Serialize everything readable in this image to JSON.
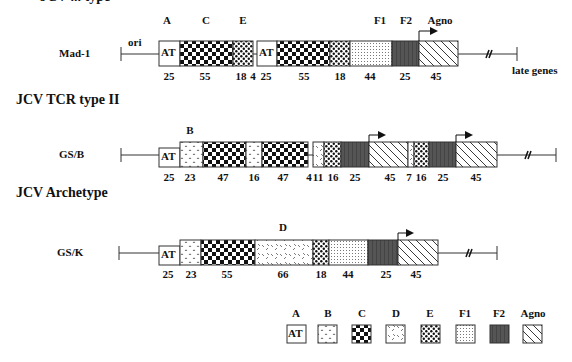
{
  "clipped_title": "JCV ... type",
  "sections": [
    {
      "title": "",
      "row_label": "Mad-1",
      "ori_label": "ori",
      "late_label": "late genes",
      "top_labels": [
        {
          "text": "A",
          "x": 167
        },
        {
          "text": "C",
          "x": 206
        },
        {
          "text": "E",
          "x": 243
        },
        {
          "text": "F1",
          "x": 380
        },
        {
          "text": "F2",
          "x": 406
        },
        {
          "text": "Agno",
          "x": 440
        }
      ],
      "segments": [
        {
          "type": "A",
          "length": 25
        },
        {
          "type": "C",
          "length": 55
        },
        {
          "type": "E",
          "length": 18
        },
        {
          "type": "gap",
          "length": 4
        },
        {
          "type": "A",
          "length": 25
        },
        {
          "type": "C",
          "length": 55
        },
        {
          "type": "E",
          "length": 18
        },
        {
          "type": "F1",
          "length": 44
        },
        {
          "type": "F2",
          "length": 25
        },
        {
          "type": "Agno",
          "length": 45
        }
      ],
      "numbers": [
        {
          "text": "25",
          "x": 169
        },
        {
          "text": "55",
          "x": 205
        },
        {
          "text": "18",
          "x": 241
        },
        {
          "text": "4",
          "x": 253
        },
        {
          "text": "25",
          "x": 265
        },
        {
          "text": "55",
          "x": 304
        },
        {
          "text": "18",
          "x": 340
        },
        {
          "text": "44",
          "x": 370
        },
        {
          "text": "25",
          "x": 405
        },
        {
          "text": "45",
          "x": 436
        }
      ]
    },
    {
      "title": "JCV TCR type II",
      "row_label": "GS/B",
      "top_labels": [
        {
          "text": "B",
          "x": 190
        }
      ],
      "segments": [
        {
          "type": "A",
          "length": 25
        },
        {
          "type": "B",
          "length": 23
        },
        {
          "type": "C",
          "length": 47
        },
        {
          "type": "B",
          "length": 16
        },
        {
          "type": "C",
          "length": 47
        },
        {
          "type": "gap",
          "length": 4
        },
        {
          "type": "B",
          "length": 11
        },
        {
          "type": "E",
          "length": 16
        },
        {
          "type": "F2",
          "length": 25
        },
        {
          "type": "Agno",
          "length": 45
        },
        {
          "type": "B",
          "length": 7
        },
        {
          "type": "E",
          "length": 16
        },
        {
          "type": "F2",
          "length": 25
        },
        {
          "type": "Agno",
          "length": 45
        }
      ],
      "numbers": [
        {
          "text": "25",
          "x": 169
        },
        {
          "text": "23",
          "x": 190
        },
        {
          "text": "47",
          "x": 223
        },
        {
          "text": "16",
          "x": 254
        },
        {
          "text": "47",
          "x": 283
        },
        {
          "text": "4",
          "x": 308
        },
        {
          "text": "11",
          "x": 318
        },
        {
          "text": "16",
          "x": 332
        },
        {
          "text": "25",
          "x": 354
        },
        {
          "text": "45",
          "x": 390
        },
        {
          "text": "7",
          "x": 408
        },
        {
          "text": "16",
          "x": 420
        },
        {
          "text": "25",
          "x": 442
        },
        {
          "text": "45",
          "x": 475
        }
      ]
    },
    {
      "title": "JCV Archetype",
      "row_label": "GS/K",
      "top_labels": [
        {
          "text": "D",
          "x": 283
        }
      ],
      "segments": [
        {
          "type": "A",
          "length": 25
        },
        {
          "type": "B",
          "length": 23
        },
        {
          "type": "C",
          "length": 55
        },
        {
          "type": "D",
          "length": 66
        },
        {
          "type": "E",
          "length": 18
        },
        {
          "type": "F1",
          "length": 44
        },
        {
          "type": "F2",
          "length": 25
        },
        {
          "type": "Agno",
          "length": 45
        }
      ],
      "numbers": [
        {
          "text": "25",
          "x": 168
        },
        {
          "text": "23",
          "x": 192
        },
        {
          "text": "55",
          "x": 227
        },
        {
          "text": "66",
          "x": 283
        },
        {
          "text": "18",
          "x": 321
        },
        {
          "text": "44",
          "x": 348
        },
        {
          "text": "25",
          "x": 386
        },
        {
          "text": "45",
          "x": 416
        }
      ]
    }
  ],
  "legend": [
    {
      "label": "A",
      "pattern": "A",
      "box_text": "AT"
    },
    {
      "label": "B",
      "pattern": "B"
    },
    {
      "label": "C",
      "pattern": "C"
    },
    {
      "label": "D",
      "pattern": "D"
    },
    {
      "label": "E",
      "pattern": "E"
    },
    {
      "label": "F1",
      "pattern": "F1"
    },
    {
      "label": "F2",
      "pattern": "F2"
    },
    {
      "label": "Agno",
      "pattern": "Agno"
    }
  ],
  "box_text_AT": "AT"
}
